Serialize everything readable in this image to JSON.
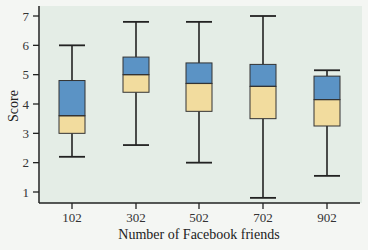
{
  "chart_data": {
    "type": "boxplot",
    "title": "",
    "xlabel": "Number of Facebook friends",
    "ylabel": "Score",
    "ylim": [
      0.7,
      7.3
    ],
    "yticks": [
      1,
      2,
      3,
      4,
      5,
      6,
      7
    ],
    "categories": [
      "102",
      "302",
      "502",
      "702",
      "902"
    ],
    "grid": false,
    "legend": null,
    "colors": {
      "upper_box": "#5b93c5",
      "lower_box": "#f2dc9e",
      "plot_background": "#e4ede6",
      "page_background": "#f4f6f3",
      "lines": "#222222"
    },
    "boxes": [
      {
        "category": "102",
        "min": 2.2,
        "q1": 3.0,
        "median": 3.6,
        "q3": 4.8,
        "max": 6.0
      },
      {
        "category": "302",
        "min": 2.6,
        "q1": 4.4,
        "median": 5.0,
        "q3": 5.6,
        "max": 6.8
      },
      {
        "category": "502",
        "min": 2.0,
        "q1": 3.75,
        "median": 4.7,
        "q3": 5.4,
        "max": 6.8
      },
      {
        "category": "702",
        "min": 0.8,
        "q1": 3.5,
        "median": 4.6,
        "q3": 5.35,
        "max": 7.0
      },
      {
        "category": "902",
        "min": 1.55,
        "q1": 3.25,
        "median": 4.15,
        "q3": 4.95,
        "max": 5.15
      }
    ]
  }
}
